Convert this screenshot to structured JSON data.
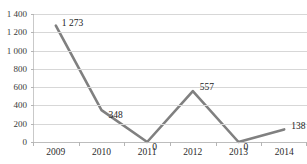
{
  "chart_data": {
    "type": "line",
    "title": "",
    "xlabel": "",
    "ylabel": "",
    "categories": [
      "2009",
      "2010",
      "2011",
      "2012",
      "2013",
      "2014"
    ],
    "values": [
      1273,
      348,
      0,
      557,
      0,
      138
    ],
    "point_labels": [
      "1 273",
      "348",
      "0",
      "557",
      "0",
      "138"
    ],
    "ylim": [
      0,
      1400
    ],
    "ytick_values": [
      0,
      200,
      400,
      600,
      800,
      1000,
      1200,
      1400
    ],
    "ytick_labels": [
      "0",
      "200",
      "400",
      "600",
      "800",
      "1 000",
      "1 200",
      "1 400"
    ],
    "grid": "horizontal",
    "legend": "none",
    "series_color": "#808080",
    "grid_color": "#d7d7d7",
    "axis_color": "#bdbdbd",
    "label_color": "#222222"
  }
}
